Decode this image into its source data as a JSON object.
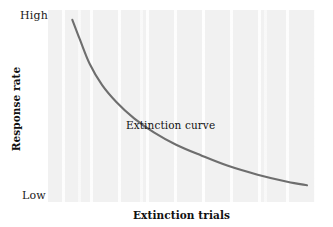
{
  "figure": {
    "background_color": "#ffffff",
    "plot_background_color": "#f1f1f1",
    "curve_color": "#6e6e6e",
    "text_color": "#111111"
  },
  "axes": {
    "y_title": "Response rate",
    "x_title": "Extinction trials",
    "y_high_label": "High",
    "y_low_label": "Low"
  },
  "annotations": {
    "curve_label": "Extinction curve"
  },
  "chart_data": {
    "type": "line",
    "title": "",
    "subtitle": "",
    "xlabel": "Extinction trials",
    "ylabel": "Response rate",
    "xlim": [
      0,
      100
    ],
    "ylim": [
      0,
      100
    ],
    "x_tick_labels": [],
    "y_tick_labels": [
      "Low",
      "High"
    ],
    "grid": false,
    "legend": null,
    "series": [
      {
        "name": "Extinction curve",
        "color": "#6e6e6e",
        "x": [
          5,
          8,
          12,
          17,
          23,
          30,
          38,
          47,
          57,
          68,
          80,
          92,
          100
        ],
        "y": [
          99,
          88,
          74,
          62,
          52,
          43,
          35,
          28,
          22,
          16,
          11,
          7,
          5
        ]
      }
    ],
    "annotations": [
      {
        "text": "Extinction curve",
        "x": 30,
        "y": 40
      }
    ]
  }
}
